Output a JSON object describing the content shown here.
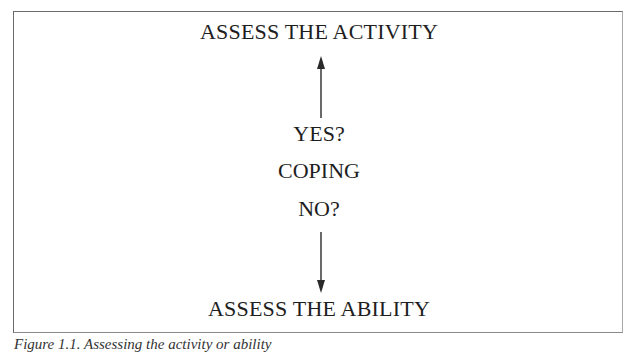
{
  "diagram": {
    "top_label": "ASSESS THE ACTIVITY",
    "middle": {
      "yes": "YES?",
      "center": "COPING",
      "no": "NO?"
    },
    "bottom_label": "ASSESS THE ABILITY",
    "arrows": [
      {
        "from": "COPING",
        "to": "ASSESS THE ACTIVITY",
        "direction": "up"
      },
      {
        "from": "COPING",
        "to": "ASSESS THE ABILITY",
        "direction": "down"
      }
    ],
    "colors": {
      "line": "#2a2a2a",
      "text": "#1e1e1e",
      "border": "#6a6a6a"
    }
  },
  "caption": "Figure 1.1. Assessing the activity or ability"
}
